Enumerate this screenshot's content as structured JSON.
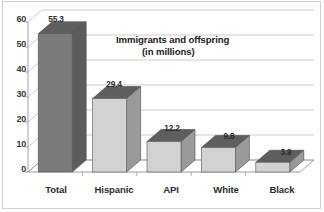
{
  "chart_data": {
    "type": "bar",
    "title": "Immigrants and offspring (in millions)",
    "title_line1": "Immigrants and offspring",
    "title_line2": "(in millions)",
    "categories": [
      "Total",
      "Hispanic",
      "API",
      "White",
      "Black"
    ],
    "values": [
      55.3,
      29.4,
      12.2,
      9.8,
      3.9
    ],
    "value_labels": [
      "55.3",
      "29.4",
      "12.2",
      "9.8",
      "3.9"
    ],
    "xlabel": "",
    "ylabel": "",
    "ylim": [
      0,
      60
    ],
    "yticks": [
      0,
      10,
      20,
      30,
      40,
      50,
      60
    ],
    "ytick_labels": [
      "0",
      "10",
      "20",
      "30",
      "40",
      "50",
      "60"
    ],
    "grid": true,
    "grid_axis": "y",
    "legend": false,
    "style": "3d",
    "colors": {
      "bar_front_primary": "#7b7b7b",
      "bar_front_other": "#d2d2d2",
      "bar_top": "#5e5e5e",
      "bar_side": "#9a9a9a",
      "grid": "#bfbfbf",
      "axis": "#9a9a9a",
      "frame": "#cfcfcf",
      "background": "#ffffff",
      "text": "#2b2b2b"
    }
  }
}
